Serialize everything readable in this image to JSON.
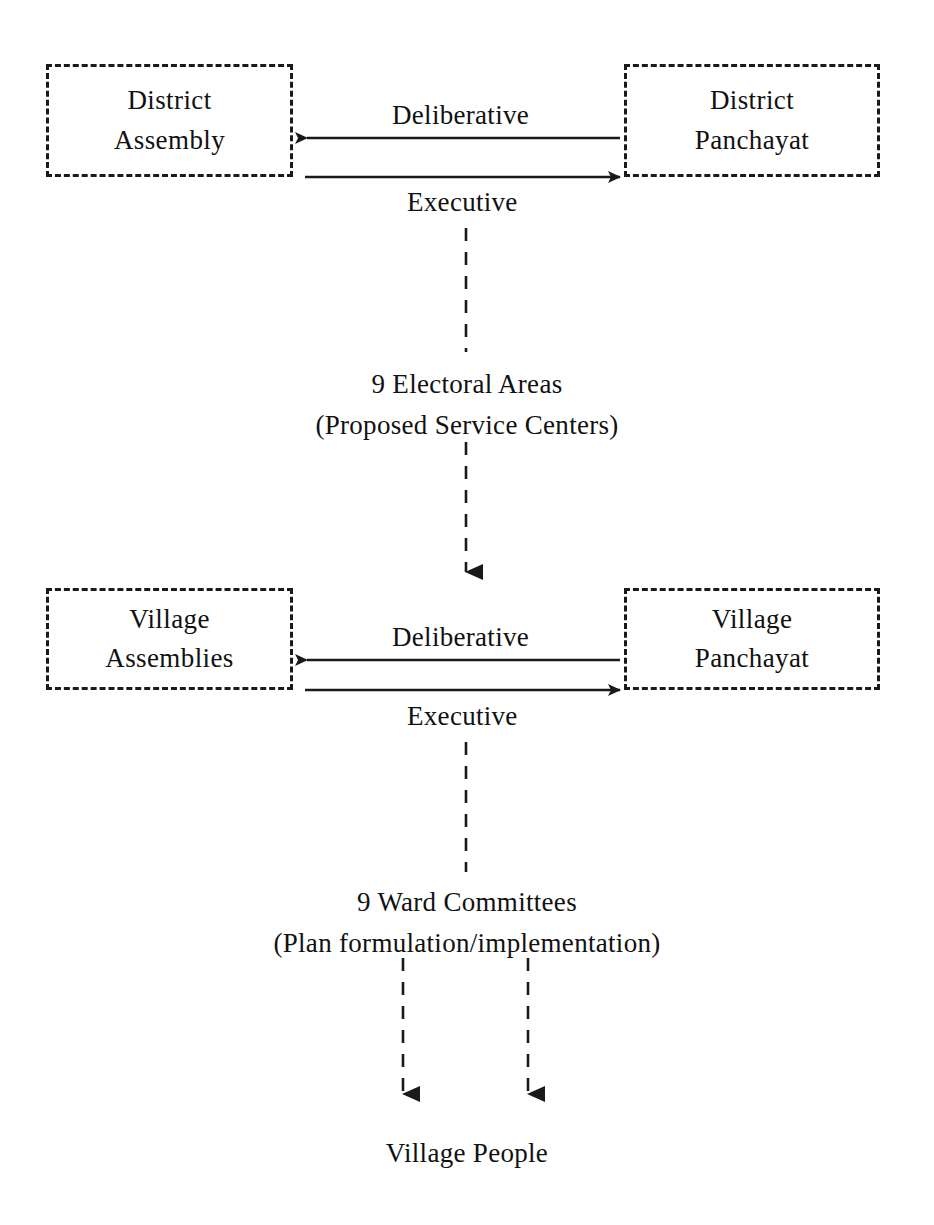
{
  "diagram": {
    "background_color": "#ffffff",
    "ink_color": "#1a1a1a",
    "nodes": [
      {
        "id": "district-assembly",
        "lines": [
          "District",
          "Assembly"
        ],
        "shape": "dashed-rectangle",
        "x": 46,
        "y": 64,
        "w": 247,
        "h": 113
      },
      {
        "id": "district-panchayat",
        "lines": [
          "District",
          "Panchayat"
        ],
        "shape": "dashed-rectangle",
        "x": 624,
        "y": 64,
        "w": 256,
        "h": 113
      },
      {
        "id": "village-assemblies",
        "lines": [
          "Village",
          "Assemblies"
        ],
        "shape": "dashed-rectangle",
        "x": 46,
        "y": 588,
        "w": 247,
        "h": 102
      },
      {
        "id": "village-panchayat",
        "lines": [
          "Village",
          "Panchayat"
        ],
        "shape": "dashed-rectangle",
        "x": 624,
        "y": 588,
        "w": 256,
        "h": 102
      }
    ],
    "edge_labels": [
      {
        "id": "deliberative-top",
        "text": "Deliberative",
        "x": 392,
        "y": 102
      },
      {
        "id": "executive-top",
        "text": "Executive",
        "x": 407,
        "y": 189
      },
      {
        "id": "deliberative-bottom",
        "text": "Deliberative",
        "x": 392,
        "y": 624
      },
      {
        "id": "executive-bottom",
        "text": "Executive",
        "x": 407,
        "y": 703
      }
    ],
    "free_texts": [
      {
        "id": "electoral-areas",
        "lines": [
          "9 Electoral Areas",
          "(Proposed Service Centers)"
        ],
        "center_x": 466,
        "y": 366
      },
      {
        "id": "ward-committees",
        "lines": [
          "9 Ward Committees",
          "(Plan formulation/implementation)"
        ],
        "center_x": 466,
        "y": 884
      },
      {
        "id": "village-people",
        "lines": [
          "Village People"
        ],
        "center_x": 466,
        "y": 1135
      }
    ],
    "connectors": [
      {
        "id": "deliberative-arrow-top",
        "style": "solid",
        "direction": "right-to-left",
        "x1": 620,
        "y1": 138,
        "x2": 305,
        "y2": 138
      },
      {
        "id": "executive-arrow-top",
        "style": "solid",
        "direction": "left-to-right",
        "x1": 305,
        "y1": 177,
        "x2": 622,
        "y2": 177
      },
      {
        "id": "deliberative-arrow-bottom",
        "style": "solid",
        "direction": "right-to-left",
        "x1": 620,
        "y1": 660,
        "x2": 305,
        "y2": 660
      },
      {
        "id": "executive-arrow-bottom",
        "style": "solid",
        "direction": "left-to-right",
        "x1": 305,
        "y1": 690,
        "x2": 622,
        "y2": 690
      },
      {
        "id": "district-to-electoral-dashed",
        "style": "dashed",
        "direction": "none",
        "x1": 466,
        "y1": 228,
        "x2": 466,
        "y2": 352
      },
      {
        "id": "electoral-to-village-dashed",
        "style": "dashed",
        "direction": "down",
        "x1": 466,
        "y1": 440,
        "x2": 466,
        "y2": 588
      },
      {
        "id": "village-to-ward-dashed",
        "style": "dashed",
        "direction": "none",
        "x1": 466,
        "y1": 742,
        "x2": 466,
        "y2": 872
      },
      {
        "id": "ward-to-people-left-dashed",
        "style": "dashed",
        "direction": "down",
        "x1": 403,
        "y1": 958,
        "x2": 403,
        "y2": 1110
      },
      {
        "id": "ward-to-people-right-dashed",
        "style": "dashed",
        "direction": "down",
        "x1": 528,
        "y1": 958,
        "x2": 528,
        "y2": 1110
      }
    ]
  }
}
